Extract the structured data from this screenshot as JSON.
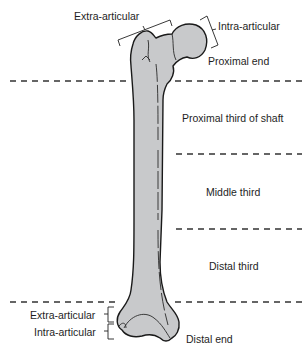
{
  "diagram": {
    "colors": {
      "bone_fill": "#c8c9cb",
      "outline": "#1a1a1a",
      "divider": "#333333",
      "background": "#ffffff"
    },
    "labels": {
      "proximal_extra_articular": "Extra-articular",
      "proximal_intra_articular": "Intra-articular",
      "proximal_end": "Proximal end",
      "proximal_third": "Proximal third of shaft",
      "middle_third": "Middle third",
      "distal_third": "Distal third",
      "distal_extra_articular": "Extra-articular",
      "distal_intra_articular": "Intra-articular",
      "distal_end": "Distal end"
    },
    "dividers_y": [
      81,
      154,
      229,
      302
    ]
  }
}
